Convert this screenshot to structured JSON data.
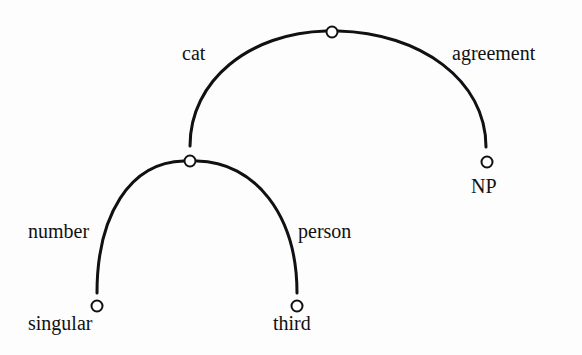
{
  "diagram": {
    "type": "feature-structure-graph",
    "nodes": [
      {
        "id": "root",
        "label": ""
      },
      {
        "id": "cat-value",
        "label": ""
      },
      {
        "id": "np",
        "label": "NP"
      },
      {
        "id": "singular",
        "label": "singular"
      },
      {
        "id": "third",
        "label": "third"
      }
    ],
    "edges": [
      {
        "from": "root",
        "to": "cat-value",
        "label": "cat"
      },
      {
        "from": "root",
        "to": "np",
        "label": "agreement"
      },
      {
        "from": "cat-value",
        "to": "singular",
        "label": "number"
      },
      {
        "from": "cat-value",
        "to": "third",
        "label": "person"
      }
    ]
  }
}
